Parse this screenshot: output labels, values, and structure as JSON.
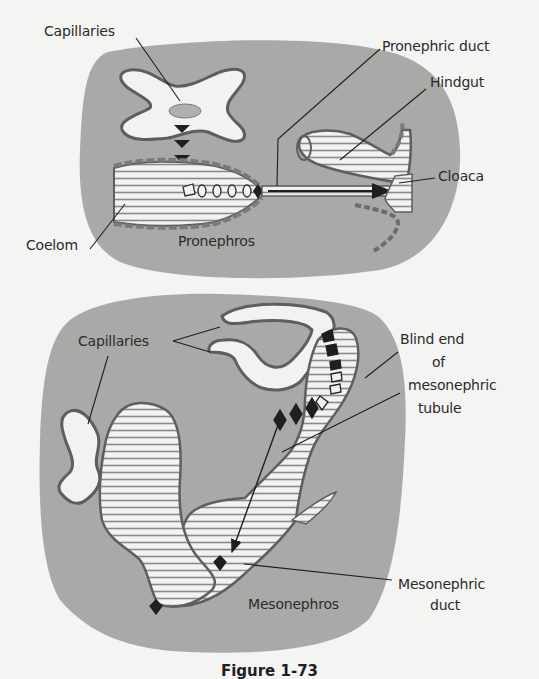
{
  "figure": {
    "caption": "Figure 1-73",
    "colors": {
      "background": "#f4f4f2",
      "tissue": "#a9a9a7",
      "lumen_white": "#f2f2f0",
      "hatch_line": "#8a8a88",
      "outline": "#5e5e5c",
      "arrow": "#1f1f1f",
      "label_text": "#2b2b2b"
    },
    "panels": [
      {
        "name": "Pronephros",
        "labels": {
          "capillaries": "Capillaries",
          "pronephric_duct": "Pronephric duct",
          "hindgut": "Hindgut",
          "cloaca": "Cloaca",
          "coelom": "Coelom",
          "title": "Pronephros"
        }
      },
      {
        "name": "Mesonephros",
        "labels": {
          "capillaries": "Capillaries",
          "blind_end_line1": "Blind end",
          "blind_end_line2": "of",
          "blind_end_line3": "mesonephric",
          "blind_end_line4": "tubule",
          "mesonephric_duct_line1": "Mesonephric",
          "mesonephric_duct_line2": "duct",
          "title": "Mesonephros"
        }
      }
    ]
  }
}
